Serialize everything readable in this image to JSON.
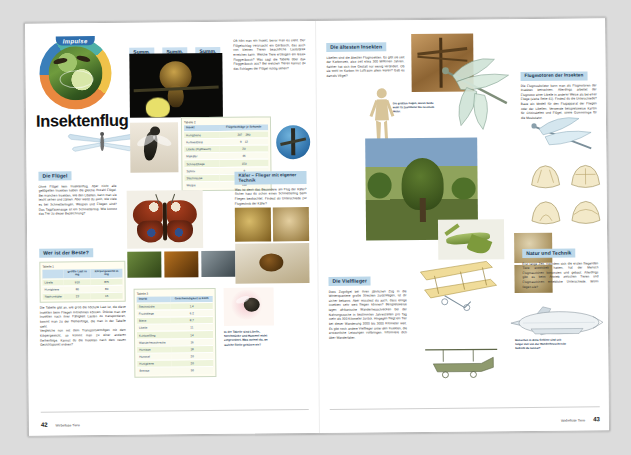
{
  "document": {
    "series_badge": "Impulse",
    "title": "Insektenflug",
    "left_page_number": "42",
    "right_page_number": "43",
    "footer_chapter": "Wirbellose Tiere"
  },
  "left_page": {
    "summ_boxes": [
      "Summ.",
      "Summ.",
      "Summ."
    ],
    "intro_text": "Oft hört man ein Insekt, bevor man es sieht. Der Flügelschlag verursacht ein Geräusch, das auch von kleinen Tieren beachtliche Lautstärke erreichen kann. Welche Tiere erzeugen ein leises Fluggeräusch? Was sagt die Tabelle über das Fluggeräusch aus? Bei welchen Tieren kannst du das Schlagen der Flügel richtig sehen?",
    "table2": {
      "label": "Tabelle 2",
      "columns": [
        "Insekt",
        "Flügelschläge je Sekunde"
      ],
      "rows": [
        [
          "Honigbiene",
          "207 – 280"
        ],
        [
          "Kohlweißling",
          "9 – 12"
        ],
        [
          "Libelle (Plattbauch)",
          "20"
        ],
        [
          "Maikäfer",
          "46"
        ],
        [
          "Schmeißfliege",
          "150"
        ],
        [
          "Sphinx",
          "9"
        ],
        [
          "Stechmücke",
          "500"
        ],
        [
          "Wespe",
          "110"
        ]
      ]
    },
    "wings_section": {
      "heading": "Die Flügel",
      "text": "Ohne Flügel kein Insektenflug. Aber nicht alle geflügelten Insekten haben die gleiche Anzahl Flügel. Bei manchen Insekten, wie den Libellen, kann man sie leicht sehen und zählen. Aber weißt du auch, wie viele es bei Schmetterlingen, Wespen und Fliegen sind? Das Tagpfauenauge ist ein Schmetterling. Wie kommt das Tier zu dieser Bezeichnung?"
    },
    "best_section": {
      "heading": "Wer ist der Beste?",
      "table1": {
        "label": "Tabelle 1",
        "columns": [
          "",
          "größte Last in mg",
          "Körpergewicht in mg"
        ],
        "rows": [
          [
            "Libelle",
            "910",
            "875"
          ],
          [
            "Honigbiene",
            "80",
            "80"
          ],
          [
            "Nashornkäfer",
            "23",
            "15"
          ]
        ]
      },
      "text": "Die Tabelle gibt an, wie groß die höchste Last ist, die diese Insekten beim Fliegen mitnehmen können. Drücke man die Insekten nach ihrer Fähigkeit Lasten zu transportieren, kommt man zu der Reihenfolge, die man in der Tabelle sieht.\nVergleiche nun mit dem Transportvermögen mit dem Körpergewicht, so kommt man zu einer anderen Reihenfolge. Kannst du die Insekten nach dem neuen Gesichtspunkt ordnen?"
    },
    "beetle_section": {
      "heading": "Käfer – Flieger mit eigener Technik",
      "text": "Was ist denn das Besondere am Flug der Käfer? Sicher hast du schon einen Schmetterling beim Fliegen beobachtet. Findest du Unterschiede zur Flugtechnik der Käfer?"
    },
    "table3": {
      "label": "Tabelle 3",
      "columns": [
        "Insekt",
        "Geschwindigkeit in km/h"
      ],
      "rows": [
        [
          "Stechmücke",
          "1,4"
        ],
        [
          "Fruchtfliege",
          "6,2"
        ],
        [
          "Biene",
          "8,7"
        ],
        [
          "Libelle",
          "11"
        ],
        [
          "Kohlweißling",
          "14"
        ],
        [
          "Wanderheuschrecke",
          "16"
        ],
        [
          "Hornisse",
          "18"
        ],
        [
          "Hummel",
          "20"
        ],
        [
          "Honigbiene",
          "20"
        ],
        [
          "Bremse",
          "50"
        ]
      ]
    },
    "table3_note": "In der Tabelle sind Libelle, Stechmücke und Hummel nicht eingeordnet. Was meinst du, an welche Stelle gehören sie?"
  },
  "right_page": {
    "oldest_section": {
      "heading": "Die ältesten Insekten",
      "text": "Libellen sind die ältesten Fluginsekten. Es gibt sie seit der Karbonzeit, also seit etwa 300 Millionen Jahren. Seither hat sich ihre Gestalt nur wenig verändert. Ob sie wohl im Karbon im Luftraum allein waren? Gab es damals Vögel?"
    },
    "oldest_caption": "Die größten nagen, waren beide wohl 75 Zentimeter bis zu einem Meter.",
    "motors_section": {
      "heading": "Flugmotoren der Insekten",
      "text": "Die Flugmuskulatur kann man als Flugmotoren der Insekten betrachten. Allerdings arbeitet der Flugmotor einer Libelle in anderer Weise als bei einer Fliege (siehe Seite 41). Findest du die Unterschiede? Baue ein Modell für den Flugapparat der Fliegen oder der Libellen. Verwende beispielsweise Karton für Chitinskelett und Flügel, sowie Gummiringe für die Muskulatur."
    },
    "many_section": {
      "heading": "Die Vielflieger",
      "text": "Dass Zugvögel bei ihren jährlichen Zug in die Winterquartiere große Strecken zurücklegen, ist dir sicher bekannt. Aber wusstest du auch, dass einige Insekten sehr weit fliegen können? Beispielsweise legen afrikanische Wanderheuschrecken bei der Nahrungssuche in bestimmten Jahreszeiten pro Tag mehr als 300 Kilometer zurück. Hingegen fliegt ein Tier bei dieser Wanderung 2000 bis 3000 Kilometer weit. Es gibt noch andere Vielflieger unter den Insekten, die erstaunliche Leistungen vollbringen. Informiere dich über Wanderfalter."
    },
    "many_caption": "Menschen in dritte Gebiete sind seit langer Zeit von der Wanderheuschrecke bedroht du nennst?",
    "tech_section": {
      "heading": "Natur und Technik",
      "text": "Erst lange Zeit, nachdem sich die ersten fliegenden Tiere entwickelt hatten, hat der Mensch Flugmaschinen konstruiert und gebaut. Allerdings gibt es beim Antrieb zwischen Tieren und Flugmaschinen erhebliche Unterschiede. Worin liegen sie?"
    }
  },
  "colors": {
    "heading_bg": "#bcd8ea",
    "heading_fg": "#18344f",
    "table_header_bg": "#c7deee",
    "table_row_a": "#eef4db",
    "table_row_b": "#fbfbef",
    "badge_bg": "#2f6fae",
    "page_bg": "#ffffff",
    "scan_bg": "#dcdcdc"
  }
}
